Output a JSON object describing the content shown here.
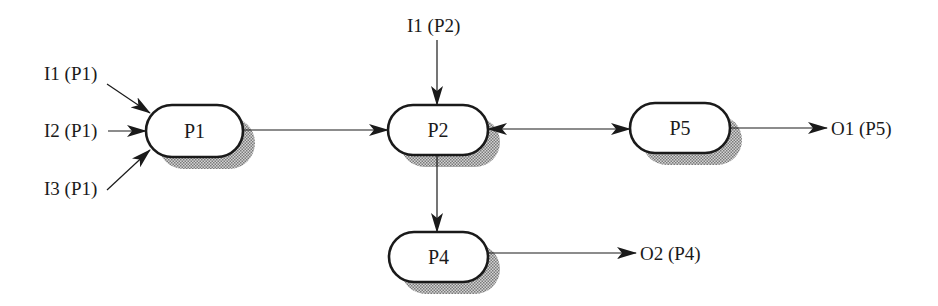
{
  "diagram": {
    "type": "process-flow",
    "colors": {
      "stroke": "#1a1a1a",
      "node_fill": "#ffffff",
      "shadow": "#9a9a9a",
      "background": "#ffffff"
    },
    "nodes": [
      {
        "id": "P1",
        "label": "P1",
        "x": 146,
        "y": 105,
        "w": 97,
        "h": 52
      },
      {
        "id": "P2",
        "label": "P2",
        "x": 388,
        "y": 105,
        "w": 100,
        "h": 50
      },
      {
        "id": "P5",
        "label": "P5",
        "x": 630,
        "y": 103,
        "w": 100,
        "h": 50
      },
      {
        "id": "P4",
        "label": "P4",
        "x": 389,
        "y": 232,
        "w": 99,
        "h": 50
      }
    ],
    "inputs": [
      {
        "label": "I1 (P1)",
        "target": "P1"
      },
      {
        "label": "I2 (P1)",
        "target": "P1"
      },
      {
        "label": "I3 (P1)",
        "target": "P1"
      },
      {
        "label": "I1 (P2)",
        "target": "P2"
      }
    ],
    "outputs": [
      {
        "label": "O1 (P5)",
        "source": "P5"
      },
      {
        "label": "O2 (P4)",
        "source": "P4"
      }
    ],
    "edges": [
      {
        "from": "P1",
        "to": "P2",
        "direction": "forward"
      },
      {
        "from": "P2",
        "to": "P5",
        "direction": "bidirectional"
      },
      {
        "from": "P2",
        "to": "P4",
        "direction": "forward"
      }
    ]
  }
}
